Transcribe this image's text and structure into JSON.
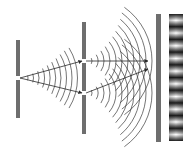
{
  "diagram": {
    "colors": {
      "background": "#ffffff",
      "barrier": "#6e6e6e",
      "barrier_edge": "#4a4a4a",
      "wave": "#3a3a3a",
      "ray": "#2a2a2a",
      "fringe_dark": "#1e1e1e",
      "fringe_light": "#ffffff"
    },
    "source_barrier": {
      "x": 16,
      "width": 4,
      "top": 40,
      "bottom": 118,
      "slit_y": 78
    },
    "double_slit_barrier": {
      "x": 82,
      "width": 4,
      "top": 22,
      "bottom": 134,
      "slit_top_y": 61,
      "slit_bottom_y": 93
    },
    "screen": {
      "x": 156,
      "width": 5,
      "top": 14,
      "bottom": 142
    },
    "fringe_pattern": {
      "x": 169,
      "width": 14,
      "top": 14,
      "bottom": 141,
      "period": 13
    },
    "rays": [
      {
        "from": [
          20,
          78
        ],
        "to": [
          82,
          61
        ]
      },
      {
        "from": [
          20,
          78
        ],
        "to": [
          82,
          93
        ]
      },
      {
        "from": [
          86,
          61
        ],
        "to": [
          148,
          61
        ]
      },
      {
        "from": [
          86,
          93
        ],
        "to": [
          148,
          69
        ]
      }
    ]
  }
}
